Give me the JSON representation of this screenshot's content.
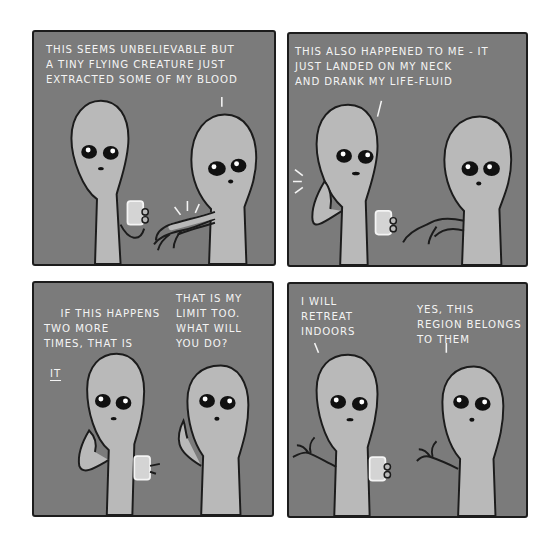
{
  "comic": {
    "colors": {
      "panel_bg": "#7b7b7b",
      "outline": "#1c1c1c",
      "alien_skin": "#b9b9b9",
      "text": "#f4f4f4",
      "page_bg": "#ffffff"
    },
    "panels": [
      {
        "id": 1,
        "dialogue": [
          {
            "speaker": "right-alien",
            "text": "THIS SEEMS UNBELIEVABLE BUT\nA TINY FLYING CREATURE JUST\nEXTRACTED SOME OF MY BLOOD"
          }
        ]
      },
      {
        "id": 2,
        "dialogue": [
          {
            "speaker": "left-alien",
            "text": "THIS ALSO HAPPENED TO ME - IT\nJUST LANDED ON MY NECK\nAND DRANK MY LIFE-FLUID"
          }
        ]
      },
      {
        "id": 3,
        "dialogue": [
          {
            "speaker": "left-alien",
            "text": "IF THIS HAPPENS\nTWO MORE\nTIMES, THAT IS",
            "emphasis": "IT"
          },
          {
            "speaker": "right-alien",
            "text": "THAT IS MY\nLIMIT TOO.\nWHAT WILL\nYOU DO?"
          }
        ]
      },
      {
        "id": 4,
        "dialogue": [
          {
            "speaker": "left-alien",
            "text": "I WILL\nRETREAT\nINDOORS"
          },
          {
            "speaker": "right-alien",
            "text": "YES, THIS\nREGION BELONGS\nTO THEM"
          }
        ]
      }
    ]
  }
}
